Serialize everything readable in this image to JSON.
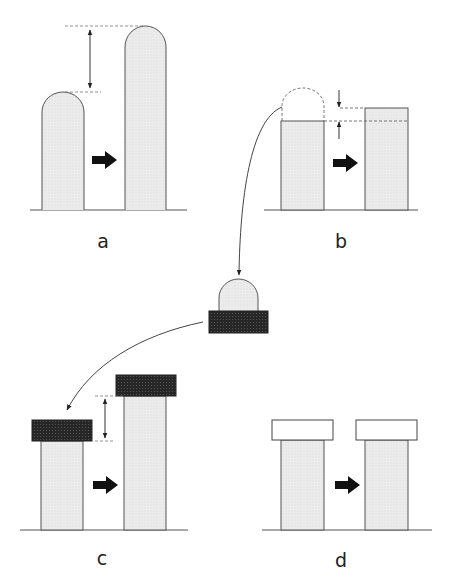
{
  "figure": {
    "panels": [
      {
        "id": "a",
        "label": "a",
        "content": "Short rounded pillar grows into tall rounded pillar; height difference indicated by double arrow"
      },
      {
        "id": "b",
        "label": "b",
        "content": "Flat-topped pillar with dashed dome removed; small height change indicated by arrows"
      },
      {
        "id": "middle",
        "label": "",
        "content": "Removed dome resting on dark hatched block"
      },
      {
        "id": "c",
        "label": "c",
        "content": "Pillars with dark caps; cap raised by height difference shown with double arrow"
      },
      {
        "id": "d",
        "label": "d",
        "content": "Pillars with light (white) caps of equal height"
      }
    ]
  },
  "colors": {
    "pillar_fill": "#ececec",
    "outline": "#555555",
    "dark_cap": "#2a2a2a",
    "light_cap": "#ffffff",
    "arrow": "#111111"
  }
}
